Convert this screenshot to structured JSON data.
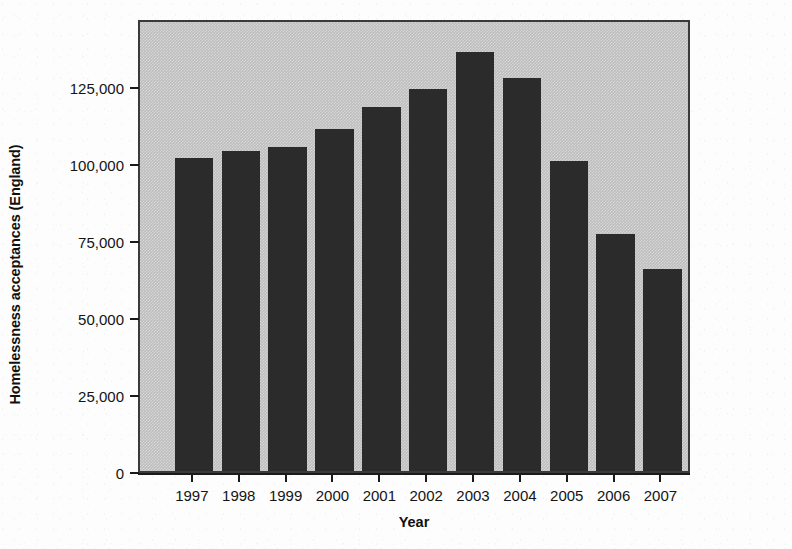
{
  "chart_data": {
    "type": "bar",
    "title": "",
    "xlabel": "Year",
    "ylabel": "Homelessness acceptances (England)",
    "categories": [
      "1997",
      "1998",
      "1999",
      "2000",
      "2001",
      "2002",
      "2003",
      "2004",
      "2005",
      "2006",
      "2007"
    ],
    "values": [
      101500,
      104000,
      105000,
      111000,
      118000,
      124000,
      136000,
      127500,
      100500,
      77000,
      65500
    ],
    "series": [
      {
        "name": "Homelessness acceptances (England)",
        "values": [
          101500,
          104000,
          105000,
          111000,
          118000,
          124000,
          136000,
          127500,
          100500,
          77000,
          65500
        ]
      }
    ],
    "ylim": [
      0,
      147000
    ],
    "ytick_values": [
      0,
      25000,
      50000,
      75000,
      100000,
      125000
    ],
    "ytick_labels": [
      "0",
      "25,000",
      "50,000",
      "75,000",
      "100,000",
      "125,000"
    ],
    "grid": false,
    "legend": false,
    "legend_position": "none",
    "bar_color": "#2b2b2b",
    "plot_background_color": "#bdbdbd",
    "axis_color": "#1a1a1a"
  }
}
